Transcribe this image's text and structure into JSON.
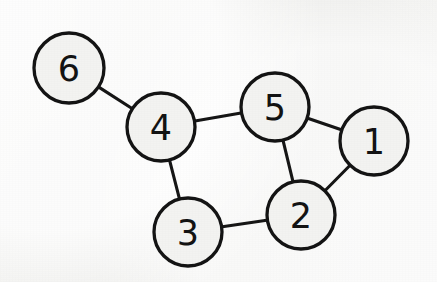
{
  "diagram": {
    "background_color": "#f2f2f0",
    "stroke_color": "#121212",
    "node_fill_color": "#f3f3f1",
    "nodes": [
      {
        "id": "1",
        "label": "1",
        "cx": 374,
        "cy": 141,
        "r": 34
      },
      {
        "id": "2",
        "label": "2",
        "cx": 301,
        "cy": 215,
        "r": 34
      },
      {
        "id": "3",
        "label": "3",
        "cx": 188,
        "cy": 232,
        "r": 34
      },
      {
        "id": "4",
        "label": "4",
        "cx": 161,
        "cy": 127,
        "r": 34
      },
      {
        "id": "5",
        "label": "5",
        "cx": 275,
        "cy": 107,
        "r": 34
      },
      {
        "id": "6",
        "label": "6",
        "cx": 69,
        "cy": 68,
        "r": 35
      }
    ],
    "edges": [
      {
        "from": "6",
        "to": "4"
      },
      {
        "from": "4",
        "to": "5"
      },
      {
        "from": "4",
        "to": "3"
      },
      {
        "from": "5",
        "to": "1"
      },
      {
        "from": "5",
        "to": "2"
      },
      {
        "from": "1",
        "to": "2"
      },
      {
        "from": "3",
        "to": "2"
      }
    ]
  }
}
